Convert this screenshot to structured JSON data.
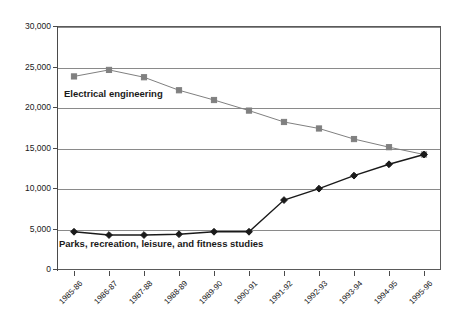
{
  "chart_data": {
    "type": "line",
    "title": "",
    "xlabel": "",
    "ylabel": "",
    "ylim": [
      0,
      30000
    ],
    "ytick_step": 5000,
    "grid": true,
    "legend_position": "inline-annotation",
    "categories": [
      "1985-86",
      "1986-87",
      "1987-88",
      "1988-89",
      "1989-90",
      "1990-91",
      "1991-92",
      "1992-93",
      "1993-94",
      "1994-95",
      "1995-96"
    ],
    "ytick_labels": [
      "30,000",
      "25,000",
      "20,000",
      "15,000",
      "10,000",
      "5,000",
      "0"
    ],
    "ytick_values": [
      30000,
      25000,
      20000,
      15000,
      10000,
      5000,
      0
    ],
    "series": [
      {
        "name": "Electrical engineering",
        "marker": "square",
        "color": "#808080",
        "values": [
          23800,
          24600,
          23700,
          22100,
          20900,
          19600,
          18200,
          17400,
          16100,
          15100,
          14200
        ]
      },
      {
        "name": "Parks, recreation, leisure, and fitness studies",
        "marker": "diamond",
        "color": "#1a1a1a",
        "values": [
          4700,
          4300,
          4300,
          4400,
          4700,
          4700,
          8600,
          10000,
          11600,
          13000,
          14200
        ]
      }
    ]
  },
  "annotations": {
    "electrical_engineering_label": "Electrical engineering",
    "parks_label": "Parks, recreation, leisure, and fitness studies"
  },
  "colors": {
    "series_electrical": "#808080",
    "series_parks": "#1a1a1a",
    "gridline": "#8a8a8a",
    "axis": "#4a4a4a",
    "text": "#1a1a1a",
    "background": "#ffffff"
  }
}
